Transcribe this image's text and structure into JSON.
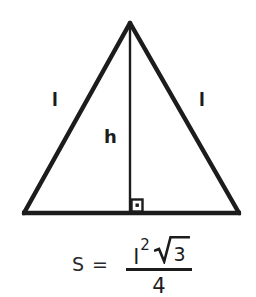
{
  "figure": {
    "background_color": "#ffffff",
    "stroke_color": "#1c1c1c"
  },
  "diagram": {
    "shape": "equilateral-triangle",
    "apex": {
      "x": 130,
      "y": 22
    },
    "base_left": {
      "x": 23,
      "y": 214
    },
    "base_right": {
      "x": 240,
      "y": 214
    },
    "height_foot": {
      "x": 130,
      "y": 214
    },
    "labels": {
      "side_left": "l",
      "side_right": "l",
      "height": "h"
    },
    "right_angle_marker": {
      "name": "right-angle-marker",
      "x": 131,
      "y": 198,
      "size": 13,
      "has_center_dot": true
    }
  },
  "formula": {
    "lhs": "S =",
    "numerator": {
      "variable": "l",
      "exponent": "2",
      "radicand": "3"
    },
    "denominator": "4",
    "plain_text": "S = l^2 * sqrt(3) / 4"
  }
}
